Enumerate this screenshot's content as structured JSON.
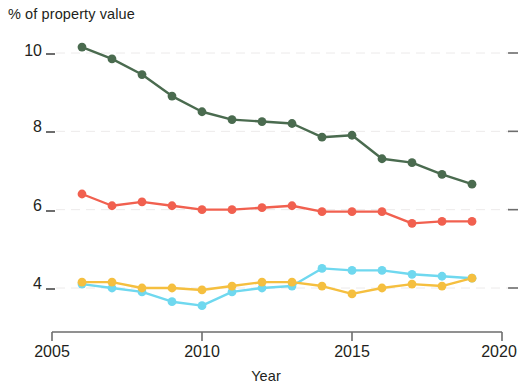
{
  "chart_data": {
    "type": "line",
    "title": "",
    "ylabel": "% of property value",
    "xlabel": "Year",
    "xlim": [
      2005,
      2020
    ],
    "ylim": [
      3.2,
      10.6
    ],
    "grid": true,
    "grid_axis": "y",
    "legend": "none",
    "x": [
      2006,
      2007,
      2008,
      2009,
      2010,
      2011,
      2012,
      2013,
      2014,
      2015,
      2016,
      2017,
      2018,
      2019
    ],
    "x_tick_labels": [
      "2005",
      "2010",
      "2015",
      "2020"
    ],
    "x_ticks": [
      2005,
      2010,
      2015,
      2020
    ],
    "y_tick_labels": [
      "10",
      "8",
      "6",
      "4"
    ],
    "y_ticks": [
      10,
      8,
      6,
      4
    ],
    "series": [
      {
        "name": "series-dark-green",
        "color": "#4a6b4f",
        "values": [
          10.15,
          9.85,
          9.45,
          8.9,
          8.5,
          8.3,
          8.25,
          8.2,
          7.85,
          7.9,
          7.3,
          7.2,
          6.9,
          6.65
        ]
      },
      {
        "name": "series-red",
        "color": "#f1604f",
        "values": [
          6.4,
          6.1,
          6.2,
          6.1,
          6.0,
          6.0,
          6.05,
          6.1,
          5.95,
          5.95,
          5.95,
          5.65,
          5.7,
          5.7
        ]
      },
      {
        "name": "series-cyan",
        "color": "#6fd8ef",
        "values": [
          4.1,
          4.0,
          3.9,
          3.65,
          3.55,
          3.9,
          4.0,
          4.05,
          4.5,
          4.45,
          4.45,
          4.35,
          4.3,
          4.25
        ]
      },
      {
        "name": "series-yellow",
        "color": "#f5bf3f",
        "values": [
          4.15,
          4.15,
          4.0,
          4.0,
          3.95,
          4.05,
          4.15,
          4.15,
          4.05,
          3.85,
          4.0,
          4.1,
          4.05,
          4.25
        ]
      }
    ]
  },
  "labels": {
    "y_axis_title": "% of property value",
    "x_axis_title": "Year",
    "y_10": "10",
    "y_8": "8",
    "y_6": "6",
    "y_4": "4",
    "x_2005": "2005",
    "x_2010": "2010",
    "x_2015": "2015",
    "x_2020": "2020"
  }
}
